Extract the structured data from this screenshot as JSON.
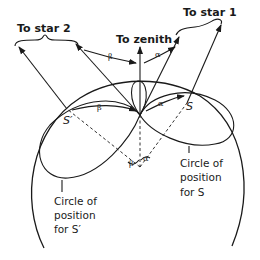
{
  "diagram": {
    "type": "celestial-navigation",
    "labels": {
      "star2": "To star 2",
      "zenith": "To zenith",
      "star1": "To star 1",
      "s_point": "S",
      "s_prime_point": "S′",
      "circle_s": [
        "Circle of",
        "position",
        "for S"
      ],
      "circle_s_prime": [
        "Circle of",
        "position",
        "for S′"
      ]
    },
    "angles": {
      "alpha": "α",
      "beta": "β"
    },
    "colors": {
      "ink": "#1a1a1a",
      "background": "#ffffff"
    }
  }
}
